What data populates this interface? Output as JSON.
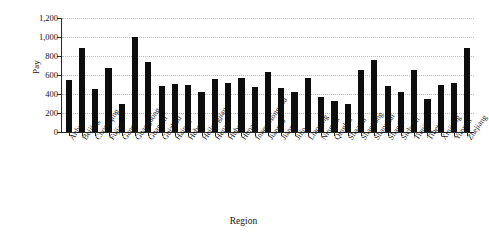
{
  "chart_data": {
    "type": "bar",
    "title": "",
    "xlabel": "Region",
    "ylabel": "Pay",
    "ylim": [
      0,
      1200
    ],
    "yticks": [
      0,
      200,
      400,
      600,
      800,
      1000,
      1200
    ],
    "ytick_labels": [
      "0",
      "200",
      "400",
      "600",
      "800",
      "1,000",
      "1,200"
    ],
    "grid": true,
    "legend": false,
    "bar_color": "#0d0d0d",
    "categories": [
      "Anhui",
      "Beijing",
      "Chongqing",
      "Fujian",
      "Gansu",
      "Guangdong",
      "Guangxi",
      "Guizhou",
      "Hainan",
      "Hebei",
      "Heilongjiang",
      "Henan",
      "Hubei",
      "Hunan",
      "Inner Mongolia",
      "Jiangsu",
      "Jiangxi",
      "Jilin",
      "Liaoning",
      "Ningxia",
      "Qinghai",
      "Shaanxi",
      "Shandong",
      "Shanghai",
      "Shanxi",
      "Sichuan",
      "Tianjin",
      "Tibet",
      "Xinjiang",
      "Yunnan",
      "Zhejiang"
    ],
    "values": [
      545,
      880,
      450,
      670,
      290,
      1000,
      740,
      480,
      510,
      500,
      425,
      555,
      515,
      570,
      475,
      630,
      465,
      420,
      565,
      365,
      325,
      300,
      655,
      760,
      480,
      425,
      655,
      350,
      490,
      520,
      880
    ]
  }
}
